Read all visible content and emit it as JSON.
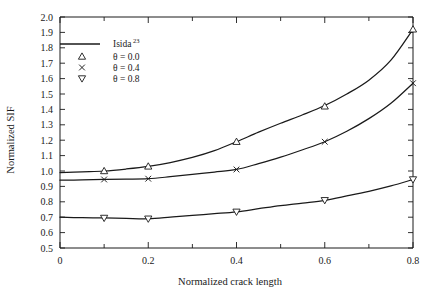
{
  "chart_data": {
    "type": "line",
    "title": "",
    "xlabel": "Normalized crack length",
    "ylabel": "Normalized SIF",
    "xlim": [
      0,
      0.8
    ],
    "ylim": [
      0.5,
      2.0
    ],
    "xticks": [
      0,
      0.2,
      0.4,
      0.6,
      0.8
    ],
    "xtick_labels": [
      "0",
      "0.2",
      "0.4",
      "0.6",
      "0.8"
    ],
    "xminor_step": 0.1,
    "yticks": [
      0.5,
      0.6,
      0.7,
      0.8,
      0.9,
      1.0,
      1.1,
      1.2,
      1.3,
      1.4,
      1.5,
      1.6,
      1.7,
      1.8,
      1.9,
      2.0
    ],
    "ytick_labels": [
      "0.5",
      "0.6",
      "0.7",
      "0.8",
      "0.9",
      "1.0",
      "1.1",
      "1.2",
      "1.3",
      "1.4",
      "1.5",
      "1.6",
      "1.7",
      "1.8",
      "1.9",
      "2.0"
    ],
    "grid": false,
    "legend_position": "upper-left",
    "reference_curve_label": "Isida",
    "reference_curve_superscript": "23",
    "series": [
      {
        "name": "theta = 0.0",
        "label": "θ = 0.0",
        "marker": "triangle-up",
        "marker_x": [
          0.1,
          0.2,
          0.4,
          0.6,
          0.8
        ],
        "marker_y": [
          1.0,
          1.03,
          1.19,
          1.42,
          1.92
        ],
        "x": [
          0.0,
          0.05,
          0.1,
          0.15,
          0.2,
          0.25,
          0.3,
          0.35,
          0.4,
          0.45,
          0.5,
          0.55,
          0.6,
          0.65,
          0.7,
          0.75,
          0.8
        ],
        "y": [
          0.99,
          0.995,
          1.0,
          1.013,
          1.03,
          1.055,
          1.088,
          1.132,
          1.19,
          1.252,
          1.31,
          1.365,
          1.425,
          1.5,
          1.59,
          1.72,
          1.92
        ]
      },
      {
        "name": "theta = 0.4",
        "label": "θ = 0.4",
        "marker": "cross",
        "marker_x": [
          0.1,
          0.2,
          0.4,
          0.6,
          0.8
        ],
        "marker_y": [
          0.945,
          0.95,
          1.01,
          1.19,
          1.57
        ],
        "x": [
          0.0,
          0.05,
          0.1,
          0.15,
          0.2,
          0.25,
          0.3,
          0.35,
          0.4,
          0.45,
          0.5,
          0.55,
          0.6,
          0.65,
          0.7,
          0.75,
          0.8
        ],
        "y": [
          0.94,
          0.942,
          0.945,
          0.947,
          0.95,
          0.963,
          0.978,
          0.993,
          1.01,
          1.048,
          1.09,
          1.138,
          1.19,
          1.258,
          1.34,
          1.44,
          1.57
        ]
      },
      {
        "name": "theta = 0.8",
        "label": "θ = 0.8",
        "marker": "triangle-down",
        "marker_x": [
          0.1,
          0.2,
          0.4,
          0.6,
          0.8
        ],
        "marker_y": [
          0.695,
          0.69,
          0.735,
          0.81,
          0.945
        ],
        "x": [
          0.0,
          0.05,
          0.1,
          0.15,
          0.2,
          0.25,
          0.3,
          0.35,
          0.4,
          0.45,
          0.5,
          0.55,
          0.6,
          0.65,
          0.7,
          0.75,
          0.8
        ],
        "y": [
          0.7,
          0.697,
          0.695,
          0.692,
          0.69,
          0.7,
          0.712,
          0.723,
          0.735,
          0.755,
          0.775,
          0.792,
          0.81,
          0.838,
          0.868,
          0.903,
          0.945
        ]
      }
    ]
  }
}
